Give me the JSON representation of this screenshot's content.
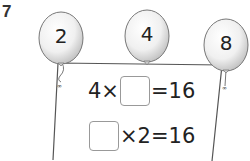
{
  "question": {
    "number": "7"
  },
  "balloons": [
    {
      "label": "2"
    },
    {
      "label": "4"
    },
    {
      "label": "8"
    }
  ],
  "equations": [
    {
      "left": "4×",
      "right": "=16"
    },
    {
      "left": "",
      "right": "×2=16"
    }
  ]
}
